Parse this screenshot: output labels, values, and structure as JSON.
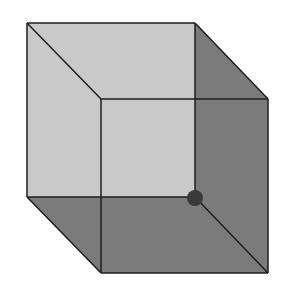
{
  "diagram": {
    "type": "necker-cube",
    "colors": {
      "background": "#ffffff",
      "light_face": "#c9c9c9",
      "dark_face": "#7b7b7b",
      "edge": "#1e1e1e",
      "dot": "#3a3a3a"
    },
    "vertices": {
      "back_top_left": [
        27,
        23
      ],
      "back_top_right": [
        195,
        23
      ],
      "back_bottom_left": [
        27,
        197
      ],
      "back_bottom_right": [
        195,
        197
      ],
      "front_top_left": [
        101,
        99
      ],
      "front_top_right": [
        268,
        99
      ],
      "front_bottom_left": [
        101,
        273
      ],
      "front_bottom_right": [
        268,
        273
      ]
    },
    "dot": {
      "cx": 195,
      "cy": 198,
      "r": 8
    }
  }
}
